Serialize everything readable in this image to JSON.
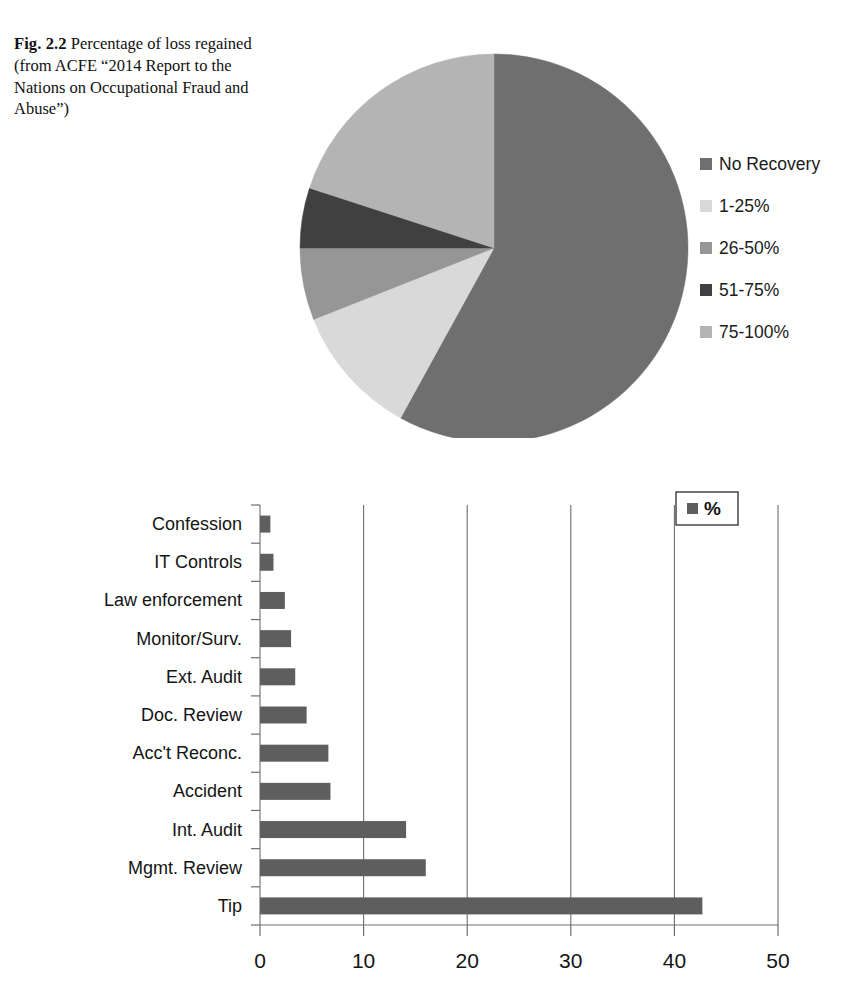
{
  "figure": {
    "number": "Fig. 2.2",
    "caption": "Percentage of loss regained (from ACFE “2014 Report to the Nations on Occupational Fraud and Abuse”)"
  },
  "colors": {
    "no_recovery": "#6f6f6f",
    "pct_1_25": "#d9d9d9",
    "pct_26_50": "#969696",
    "pct_51_75": "#404040",
    "pct_75_100": "#b4b4b4",
    "bar_fill": "#5e5e5e",
    "axis": "#6e6e6e",
    "text": "#141414"
  },
  "chart_data": [
    {
      "type": "pie",
      "title": "Percentage of loss regained",
      "legend_position": "right",
      "labels": [
        "No Recovery",
        "1-25%",
        "26-50%",
        "51-75%",
        "75-100%"
      ],
      "values": [
        58,
        11,
        6,
        5,
        20
      ],
      "colors": [
        "#6f6f6f",
        "#d9d9d9",
        "#969696",
        "#404040",
        "#b4b4b4"
      ],
      "start_angle": 0,
      "direction": "clockwise"
    },
    {
      "type": "bar",
      "orientation": "horizontal",
      "title": "",
      "xlabel": "",
      "ylabel": "",
      "legend": [
        "%"
      ],
      "legend_position": "top-right",
      "categories": [
        "Confession",
        "IT Controls",
        "Law enforcement",
        "Monitor/Surv.",
        "Ext. Audit",
        "Doc. Review",
        "Acc't Reconc.",
        "Accident",
        "Int. Audit",
        "Mgmt. Review",
        "Tip"
      ],
      "values": [
        1.0,
        1.3,
        2.4,
        3.0,
        3.4,
        4.5,
        6.6,
        6.8,
        14.1,
        16.0,
        42.7
      ],
      "xlim": [
        0,
        50
      ],
      "xticks": [
        0,
        10,
        20,
        30,
        40,
        50
      ],
      "xtick_labels": [
        "0",
        "10",
        "20",
        "30",
        "40",
        "50"
      ],
      "grid": true,
      "grid_axis": "x"
    }
  ],
  "pie_legend": [
    {
      "label": "No Recovery",
      "color": "#6f6f6f"
    },
    {
      "label": "1-25%",
      "color": "#d9d9d9"
    },
    {
      "label": "26-50%",
      "color": "#969696"
    },
    {
      "label": "51-75%",
      "color": "#404040"
    },
    {
      "label": "75-100%",
      "color": "#b4b4b4"
    }
  ],
  "bar_legend": {
    "label": "%",
    "color": "#5e5e5e"
  }
}
